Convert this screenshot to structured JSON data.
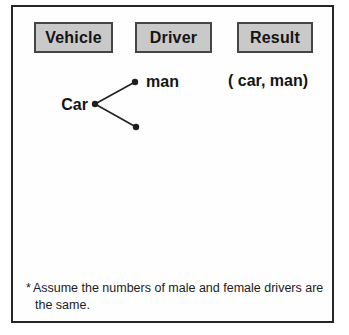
{
  "headers": [
    {
      "label": "Vehicle"
    },
    {
      "label": "Driver"
    },
    {
      "label": "Result"
    }
  ],
  "mapping": {
    "vehicle_node": "Car",
    "driver_node_labeled": "man",
    "driver_node_unlabeled": "",
    "result_pair": "( car, man)"
  },
  "footnote": {
    "marker": "*",
    "text": "Assume the numbers of male and female drivers are the same."
  },
  "colors": {
    "header_fill": "#c9c9c9",
    "header_border": "#454545",
    "frame_border": "#262626",
    "ink": "#141414",
    "background": "#ffffff"
  }
}
